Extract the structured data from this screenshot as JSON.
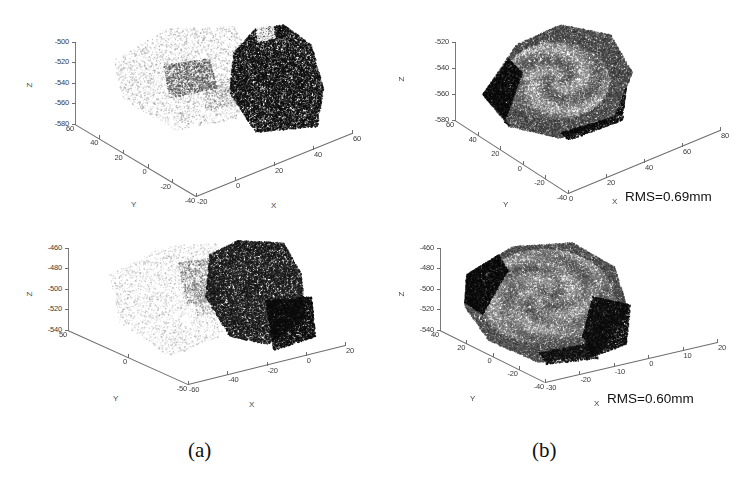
{
  "figure": {
    "width": 744,
    "height": 480,
    "background": "#ffffff"
  },
  "captions": [
    {
      "id": "caption-a",
      "label": "(a)"
    },
    {
      "id": "caption-b",
      "label": "(b)"
    }
  ],
  "axis_names": {
    "x": "X",
    "y": "Y",
    "z": "Z"
  },
  "annotations": [
    {
      "id": "rms-top",
      "label": "RMS=0.69mm"
    },
    {
      "id": "rms-bottom",
      "label": "RMS=0.60mm"
    }
  ],
  "chart_data": [
    {
      "id": "panel-top-left",
      "type": "scatter",
      "title": "",
      "subtitle": "unregistered pair, view 1",
      "xlabel": "X",
      "ylabel": "Y",
      "zlabel": "Z",
      "xticks": [
        -20,
        0,
        20,
        40,
        60
      ],
      "yticks": [
        60,
        40,
        20,
        0,
        -20,
        -40
      ],
      "zticks": [
        -500,
        -520,
        -540,
        -560,
        -580
      ],
      "xlim": [
        -20,
        60
      ],
      "ylim": [
        -40,
        60
      ],
      "zlim": [
        -580,
        -500
      ],
      "grid": false,
      "legend": null,
      "series": [
        {
          "name": "reference cloud",
          "color": "#c9c9c9",
          "rendered": "light-gray point cloud, left"
        },
        {
          "name": "floating cloud",
          "color": "#1a1a1a",
          "rendered": "dark point cloud, right"
        }
      ]
    },
    {
      "id": "panel-top-right",
      "type": "scatter",
      "title": "",
      "subtitle": "registered pair, view 1",
      "xlabel": "X",
      "ylabel": "Y",
      "zlabel": "Z",
      "xticks": [
        0,
        20,
        40,
        60,
        80
      ],
      "yticks": [
        60,
        40,
        20,
        0,
        -20,
        -40
      ],
      "zticks": [
        -520,
        -540,
        -560,
        -580
      ],
      "xlim": [
        0,
        80
      ],
      "ylim": [
        -40,
        60
      ],
      "zlim": [
        -580,
        -520
      ],
      "grid": false,
      "legend": null,
      "annotation": "RMS=0.69mm",
      "series": [
        {
          "name": "reference cloud",
          "color": "#c9c9c9",
          "rendered": "light-gray point cloud, overlapped"
        },
        {
          "name": "floating cloud",
          "color": "#1a1a1a",
          "rendered": "dark point cloud, overlapped"
        }
      ]
    },
    {
      "id": "panel-bottom-left",
      "type": "scatter",
      "title": "",
      "subtitle": "unregistered pair, view 2",
      "xlabel": "X",
      "ylabel": "Y",
      "zlabel": "Z",
      "xticks": [
        -60,
        -40,
        -20,
        0,
        20
      ],
      "yticks": [
        50,
        0,
        -50
      ],
      "zticks": [
        -460,
        -480,
        -500,
        -520,
        -540
      ],
      "xlim": [
        -60,
        20
      ],
      "ylim": [
        -50,
        50
      ],
      "zlim": [
        -540,
        -460
      ],
      "grid": false,
      "legend": null,
      "series": [
        {
          "name": "reference cloud",
          "color": "#cccccc",
          "rendered": "light-gray point cloud, left"
        },
        {
          "name": "floating cloud",
          "color": "#141414",
          "rendered": "dark point cloud, right"
        }
      ]
    },
    {
      "id": "panel-bottom-right",
      "type": "scatter",
      "title": "",
      "subtitle": "registered pair, view 2",
      "xlabel": "X",
      "ylabel": "Y",
      "zlabel": "Z",
      "xticks": [
        -30,
        -20,
        -10,
        0,
        10,
        20
      ],
      "yticks": [
        40,
        20,
        0,
        -20,
        -40
      ],
      "zticks": [
        -460,
        -480,
        -500,
        -520,
        -540
      ],
      "xlim": [
        -30,
        20
      ],
      "ylim": [
        -40,
        40
      ],
      "zlim": [
        -540,
        -460
      ],
      "grid": false,
      "legend": null,
      "annotation": "RMS=0.60mm",
      "series": [
        {
          "name": "reference cloud",
          "color": "#cccccc",
          "rendered": "light-gray point cloud, overlapped"
        },
        {
          "name": "floating cloud",
          "color": "#141414",
          "rendered": "dark point cloud, overlapped"
        }
      ]
    }
  ]
}
